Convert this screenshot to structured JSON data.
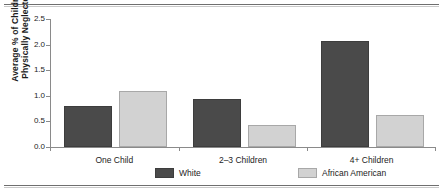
{
  "chart_data": {
    "type": "bar",
    "title": "",
    "subtitle": "",
    "xlabel": "",
    "ylabel": "Average % of Children Physically Neglected",
    "ylabel_lines": [
      "Average % of Children",
      "Physically Neglected"
    ],
    "categories": [
      "One Child",
      "2–3 Children",
      "4+ Children"
    ],
    "series": [
      {
        "name": "White",
        "values": [
          0.76,
          0.9,
          2.03
        ],
        "color": "#4a4a4a"
      },
      {
        "name": "African American",
        "values": [
          1.05,
          0.39,
          0.58
        ],
        "color": "#d2d2d2"
      }
    ],
    "ylim": [
      0.0,
      2.5
    ],
    "yticks": [
      0.0,
      0.5,
      1.0,
      1.5,
      2.0,
      2.5
    ],
    "ytick_labels": [
      "0.0",
      "0.5",
      "1.0",
      "1.5",
      "2.0",
      "2.5"
    ],
    "grid": false,
    "legend_position": "bottom"
  },
  "colors": {
    "white_series": "#4a4a4a",
    "african_american_series": "#d2d2d2",
    "axis": "#8a8a8a",
    "text": "#1c1c1c",
    "rule": "#6f6f6f"
  }
}
